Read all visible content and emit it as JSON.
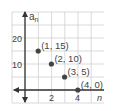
{
  "chart_data": {
    "type": "scatter",
    "title": "",
    "xlabel": "n",
    "ylabel": "a_n",
    "xlabel_main": "n",
    "ylabel_main": "a",
    "ylabel_sub": "n",
    "x_ticks": [
      "2",
      "4"
    ],
    "y_ticks": [
      "10",
      "20"
    ],
    "xlim": [
      -2,
      5
    ],
    "ylim": [
      -4,
      30
    ],
    "grid": true,
    "points": [
      {
        "x": 1,
        "y": 15,
        "label": "(1, 15)"
      },
      {
        "x": 2,
        "y": 10,
        "label": "(2, 10)"
      },
      {
        "x": 3,
        "y": 5,
        "label": "(3, 5)"
      },
      {
        "x": 4,
        "y": 0,
        "label": "(4, 0)"
      }
    ],
    "colors": {
      "grid": "#d0d0d0",
      "axis": "#333333",
      "point": "#444444",
      "text": "#444444"
    }
  }
}
